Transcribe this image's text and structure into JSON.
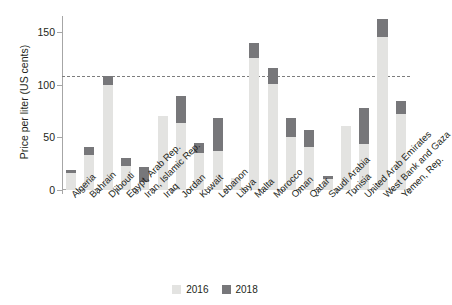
{
  "chart_data": {
    "type": "bar",
    "title": "",
    "subtitle": "",
    "xlabel": "",
    "ylabel": "Price per liter (US cents)",
    "ylim": [
      0,
      165
    ],
    "yticks": [
      0,
      50,
      100,
      150
    ],
    "ytick_labels": [
      "0",
      "50",
      "100",
      "150"
    ],
    "grid": false,
    "legend_position": "bottom-center",
    "stacked_style": "overlay",
    "reference_line": {
      "name": "dashed-reference-line",
      "value": 108,
      "style": "dashed",
      "color": "#7d7d7d"
    },
    "categories": [
      "Algeria",
      "Bahrain",
      "Djibouti",
      "Egypt, Arab Rep.",
      "Iran, Islamic Rep.",
      "Iraq",
      "Jordan",
      "Kuwait",
      "Lebanon",
      "Libya",
      "Malta",
      "Morocco",
      "Oman",
      "Qatar",
      "Saudi Arabia",
      "Tunisia",
      "United Arab Emirates",
      "West Bank and Gaza",
      "Yemen, Rep."
    ],
    "series": [
      {
        "name": "2016",
        "color": "#e3e3e1",
        "values": [
          16,
          33,
          100,
          23,
          8,
          70,
          64,
          35,
          37,
          11,
          125,
          101,
          50,
          41,
          10,
          61,
          44,
          145,
          72
        ]
      },
      {
        "name": "2018",
        "color": "#77777a",
        "values": [
          19,
          41,
          108,
          30,
          22,
          62,
          89,
          45,
          68,
          4,
          139,
          116,
          68,
          57,
          13,
          50,
          78,
          162,
          84
        ]
      }
    ]
  },
  "legend": {
    "items": [
      {
        "label": "2016",
        "color": "#e3e3e1"
      },
      {
        "label": "2018",
        "color": "#77777a"
      }
    ]
  }
}
